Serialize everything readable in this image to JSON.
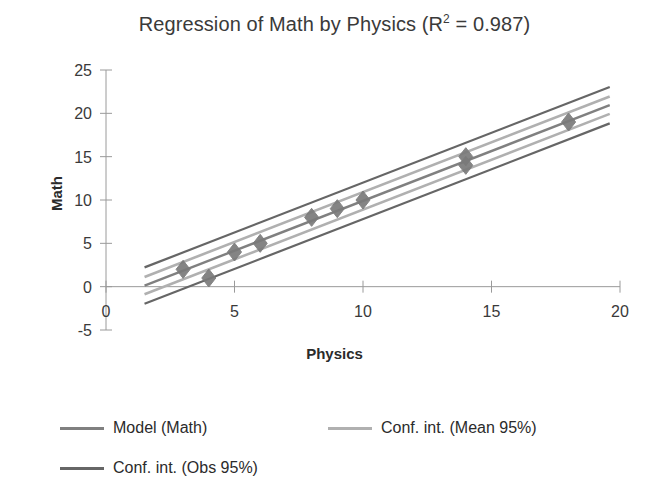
{
  "chart_data": {
    "type": "scatter",
    "title_main": "Regression of Math by Physics (R",
    "title_sup": "2",
    "title_tail": " = 0.987)",
    "xlabel": "Physics",
    "ylabel": "Math",
    "xlim": [
      0,
      20
    ],
    "ylim": [
      -5,
      25
    ],
    "xticks": [
      "0",
      "5",
      "10",
      "15",
      "20"
    ],
    "xtick_values": [
      0,
      5,
      10,
      15,
      20
    ],
    "yticks": [
      "25",
      "20",
      "15",
      "10",
      "5",
      "0",
      "-5"
    ],
    "ytick_values": [
      25,
      20,
      15,
      10,
      5,
      0,
      -5
    ],
    "grid": false,
    "legend_position": "bottom-left",
    "r_squared": 0.987,
    "observations": {
      "name": "Math",
      "marker": "diamond",
      "x": [
        3,
        4,
        5,
        6,
        8,
        9,
        10,
        14,
        14,
        18
      ],
      "y": [
        2,
        1,
        4,
        5,
        8,
        9,
        10,
        14,
        15,
        19
      ]
    },
    "model_line": {
      "name": "Model (Math)",
      "color": "#808080",
      "intercept": -1.6,
      "slope": 1.15,
      "x_range": [
        1.5,
        19.6
      ]
    },
    "conf_int_mean": {
      "name": "Conf. int. (Mean 95%)",
      "color": "#b0b0b0",
      "offset_at_xmin": 1.0,
      "offset_at_xmax": 1.0
    },
    "conf_int_obs": {
      "name": "Conf. int. (Obs 95%)",
      "color": "#666666",
      "offset_at_xmin": 2.1,
      "offset_at_xmax": 2.1
    },
    "series": [
      {
        "name": "Model (Math)",
        "color": "#808080",
        "kind": "line"
      },
      {
        "name": "Conf. int. (Mean 95%)",
        "color": "#b0b0b0",
        "kind": "line"
      },
      {
        "name": "Conf. int. (Obs 95%)",
        "color": "#666666",
        "kind": "line"
      }
    ]
  },
  "legend": {
    "items": [
      {
        "label": "Model (Math)",
        "color": "#808080"
      },
      {
        "label": "Conf. int. (Mean 95%)",
        "color": "#b0b0b0"
      },
      {
        "label": "Conf. int. (Obs 95%)",
        "color": "#666666"
      }
    ]
  },
  "colors": {
    "axis": "#9a9a9a",
    "text": "#2b2b2b",
    "marker": "#7a7a7a",
    "background": "#ffffff"
  }
}
